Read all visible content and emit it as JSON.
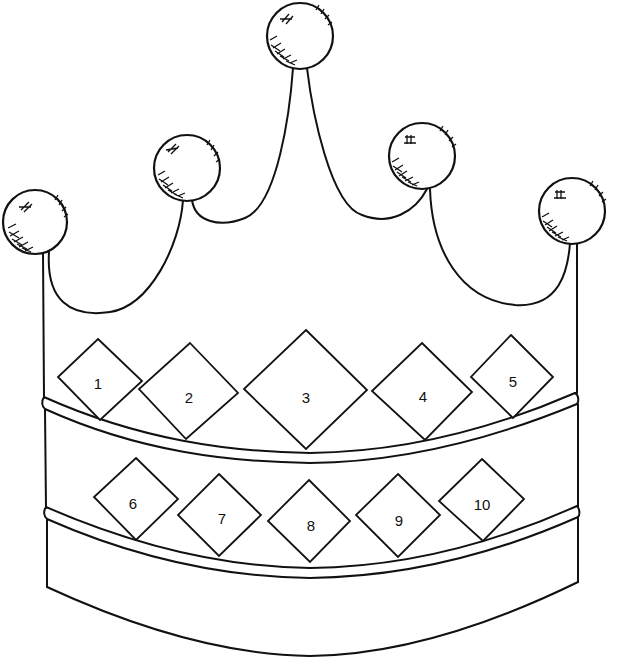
{
  "image": {
    "subject": "crown coloring page",
    "colors": {
      "line": "#111111",
      "background": "#ffffff"
    }
  },
  "balls": [
    {
      "id": "ball-1",
      "cx": 35,
      "cy": 222,
      "r": 32
    },
    {
      "id": "ball-2",
      "cx": 187,
      "cy": 168,
      "r": 33
    },
    {
      "id": "ball-3",
      "cx": 300,
      "cy": 36,
      "r": 33
    },
    {
      "id": "ball-4",
      "cx": 422,
      "cy": 156,
      "r": 33
    },
    {
      "id": "ball-5",
      "cx": 572,
      "cy": 211,
      "r": 33
    }
  ],
  "jewels": [
    {
      "label": "1",
      "cx": 98,
      "cy": 381,
      "r": 42
    },
    {
      "label": "2",
      "cx": 189,
      "cy": 391,
      "r": 48
    },
    {
      "label": "3",
      "cx": 306,
      "cy": 389,
      "r": 61
    },
    {
      "label": "4",
      "cx": 422,
      "cy": 392,
      "r": 49
    },
    {
      "label": "5",
      "cx": 512,
      "cy": 377,
      "r": 41
    },
    {
      "label": "6",
      "cx": 136,
      "cy": 498,
      "r": 42
    },
    {
      "label": "7",
      "cx": 219,
      "cy": 516,
      "r": 41
    },
    {
      "label": "8",
      "cx": 310,
      "cy": 521,
      "r": 41
    },
    {
      "label": "9",
      "cx": 398,
      "cy": 516,
      "r": 41
    },
    {
      "label": "10",
      "cx": 481,
      "cy": 500,
      "r": 42
    }
  ]
}
